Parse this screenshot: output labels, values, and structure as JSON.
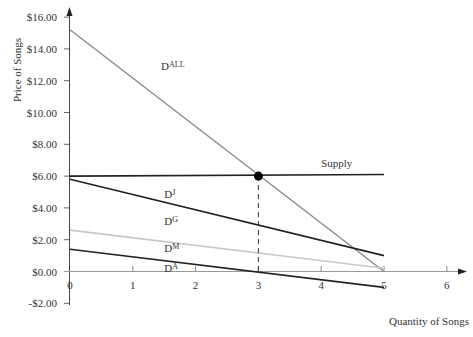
{
  "chart_data": {
    "type": "line",
    "title": "",
    "xlabel": "Quantity of Songs",
    "ylabel": "Price of Songs",
    "xlim": [
      0,
      6
    ],
    "ylim": [
      -2,
      16
    ],
    "x_ticks": [
      "0",
      "1",
      "2",
      "3",
      "4",
      "5",
      "6"
    ],
    "y_ticks": [
      "$16.00",
      "$14.00",
      "$12.00",
      "$10.00",
      "$8.00",
      "$6.00",
      "$4.00",
      "$2.00",
      "$0.00",
      "-$2.00"
    ],
    "grid": false,
    "legend": "inline labels",
    "series": [
      {
        "name": "D^ALL",
        "label_main": "D",
        "label_sup": "ALL",
        "color": "#8a8a8a",
        "x": [
          0,
          5
        ],
        "y": [
          15.2,
          0.0
        ],
        "label_pos": [
          1.45,
          12.7
        ]
      },
      {
        "name": "Supply",
        "label_main": "Supply",
        "label_sup": "",
        "color": "#222222",
        "x": [
          0,
          5
        ],
        "y": [
          6.0,
          6.1
        ],
        "label_pos": [
          4.0,
          6.6
        ]
      },
      {
        "name": "D^J",
        "label_main": "D",
        "label_sup": "J",
        "color": "#222222",
        "x": [
          0,
          5
        ],
        "y": [
          5.8,
          1.0
        ],
        "label_pos": [
          1.5,
          4.6
        ]
      },
      {
        "name": "D^G",
        "label_main": "D",
        "label_sup": "G",
        "color": "#c8c8c8",
        "x": [
          0,
          5
        ],
        "y": [
          2.6,
          0.2
        ],
        "label_pos": [
          1.5,
          2.9
        ]
      },
      {
        "name": "D^M",
        "label_main": "D",
        "label_sup": "M",
        "color": "#d8d8d8",
        "x": [
          0,
          5
        ],
        "y": [
          2.6,
          0.2
        ],
        "label_pos": [
          1.5,
          1.2
        ]
      },
      {
        "name": "D^A",
        "label_main": "D",
        "label_sup": "A",
        "color": "#222222",
        "x": [
          0,
          5
        ],
        "y": [
          1.4,
          -1.0
        ],
        "label_pos": [
          1.5,
          -0.05
        ]
      }
    ],
    "annotations": [
      {
        "type": "point",
        "x": 3,
        "y": 6.0,
        "label": "equilibrium"
      },
      {
        "type": "dashed-vline",
        "x": 3,
        "y_from": 6.0,
        "y_to": 0
      }
    ]
  }
}
